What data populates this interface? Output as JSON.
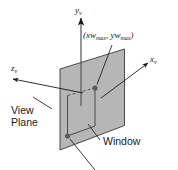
{
  "figure": {
    "background_color": "#ffffff",
    "line_color": "#1a1a1a",
    "plane_fill": "#b6b6b6",
    "plane_stroke": "#3a3a3a",
    "window_stroke": "#4a4a4a",
    "marker_color": "#5a5a5a"
  },
  "axes": [
    {
      "id": "y-axis",
      "base": "y",
      "subscript": "v",
      "label": "y",
      "direction": "up"
    },
    {
      "id": "x-axis",
      "base": "x",
      "subscript": "v",
      "label": "x",
      "direction": "upper-right"
    },
    {
      "id": "z-axis",
      "base": "z",
      "subscript": "v",
      "label": "z",
      "direction": "left"
    }
  ],
  "annotations": {
    "coordinate_point": {
      "open_paren": "(",
      "x_base": "xw",
      "x_subscript": "max",
      "separator": ", ",
      "y_base": "yw",
      "y_subscript": "max",
      "close_paren": ")",
      "full_text": "(xwmax, ywmax)"
    },
    "view_plane": {
      "line1": "View",
      "line2": "Plane"
    },
    "window": {
      "label": "Window"
    }
  },
  "markers": [
    {
      "name": "window-max-corner",
      "x": 95,
      "y": 88
    },
    {
      "name": "window-min-corner",
      "x": 67.5,
      "y": 136
    }
  ]
}
